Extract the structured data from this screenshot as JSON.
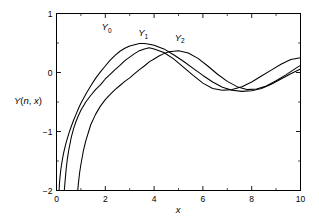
{
  "chart_data": {
    "type": "line",
    "title": "",
    "subtitle": "",
    "xlabel": "x",
    "ylabel": "Y(n, x)",
    "xlim": [
      0,
      10
    ],
    "ylim": [
      -2,
      1
    ],
    "grid": false,
    "legend_position": "inline-annotations",
    "x_ticks_major": [
      0,
      2,
      4,
      6,
      8,
      10
    ],
    "x_ticks_major_labels": [
      "0",
      "2",
      "4",
      "6",
      "8",
      "10"
    ],
    "x_ticks_minor": [
      1,
      3,
      5,
      7,
      9
    ],
    "y_ticks_major": [
      1,
      0,
      -1,
      -2
    ],
    "y_ticks_major_labels": [
      "1",
      "0",
      "−1",
      "−2"
    ],
    "y_ticks_minor": [
      0.5,
      -0.5,
      -1.5
    ],
    "annotations": [
      {
        "name": "Y0",
        "text": "Y",
        "sub": "0",
        "x": 2.05,
        "y": 0.72
      },
      {
        "name": "Y1",
        "text": "Y",
        "sub": "1",
        "x": 3.55,
        "y": 0.62
      },
      {
        "name": "Y2",
        "text": "Y",
        "sub": "2",
        "x": 5.05,
        "y": 0.54
      }
    ],
    "series": [
      {
        "name": "Y0",
        "label": "Y₀",
        "color": "#000000",
        "x": [
          0.105,
          0.12,
          0.14,
          0.16,
          0.18,
          0.2,
          0.25,
          0.3,
          0.35,
          0.4,
          0.5,
          0.6,
          0.7,
          0.8,
          0.9,
          1.0,
          1.2,
          1.4,
          1.6,
          1.8,
          2.0,
          2.2,
          2.4,
          2.6,
          2.8,
          3.0,
          3.2,
          3.4,
          3.6,
          3.8,
          4.0,
          4.4,
          4.8,
          5.2,
          5.6,
          6.0,
          6.4,
          6.8,
          7.2,
          7.6,
          8.0,
          8.4,
          8.8,
          9.2,
          9.6,
          10.0
        ],
        "y": [
          -2.0,
          -1.89,
          -1.79,
          -1.71,
          -1.64,
          -1.58,
          -1.45,
          -1.35,
          -1.26,
          -1.18,
          -1.04,
          -0.92,
          -0.81,
          -0.71,
          -0.61,
          -0.52,
          -0.37,
          -0.23,
          -0.1,
          0.01,
          0.11,
          0.21,
          0.29,
          0.36,
          0.41,
          0.45,
          0.47,
          0.49,
          0.49,
          0.48,
          0.46,
          0.4,
          0.3,
          0.19,
          0.07,
          -0.05,
          -0.16,
          -0.25,
          -0.3,
          -0.32,
          -0.31,
          -0.27,
          -0.2,
          -0.11,
          -0.02,
          0.06
        ],
        "y_approx_note": "Bessel Y0(x)"
      },
      {
        "name": "Y1",
        "label": "Y₁",
        "color": "#000000",
        "x": [
          0.32,
          0.35,
          0.4,
          0.45,
          0.5,
          0.6,
          0.7,
          0.8,
          0.9,
          1.0,
          1.2,
          1.4,
          1.6,
          1.8,
          2.0,
          2.2,
          2.4,
          2.6,
          2.8,
          3.0,
          3.2,
          3.4,
          3.6,
          3.8,
          4.0,
          4.4,
          4.8,
          5.2,
          5.6,
          6.0,
          6.4,
          6.8,
          7.2,
          7.6,
          8.0,
          8.4,
          8.8,
          9.2,
          9.6,
          10.0
        ],
        "y": [
          -2.0,
          -1.85,
          -1.62,
          -1.45,
          -1.32,
          -1.11,
          -0.95,
          -0.83,
          -0.73,
          -0.64,
          -0.5,
          -0.39,
          -0.29,
          -0.21,
          -0.11,
          -0.03,
          0.05,
          0.12,
          0.2,
          0.26,
          0.32,
          0.37,
          0.4,
          0.42,
          0.4,
          0.34,
          0.23,
          0.09,
          -0.05,
          -0.18,
          -0.27,
          -0.3,
          -0.29,
          -0.24,
          -0.16,
          -0.06,
          0.04,
          0.14,
          0.22,
          0.25
        ],
        "y_approx_note": "Bessel Y1(x)"
      },
      {
        "name": "Y2",
        "label": "Y₂",
        "color": "#000000",
        "x": [
          0.87,
          0.9,
          0.95,
          1.0,
          1.1,
          1.2,
          1.4,
          1.6,
          1.8,
          2.0,
          2.2,
          2.4,
          2.6,
          2.8,
          3.0,
          3.2,
          3.4,
          3.6,
          3.8,
          4.0,
          4.2,
          4.4,
          4.6,
          4.8,
          5.0,
          5.4,
          5.8,
          6.2,
          6.6,
          7.0,
          7.4,
          7.8,
          8.2,
          8.6,
          9.0,
          9.4,
          9.8,
          10.0
        ],
        "y": [
          -2.0,
          -1.87,
          -1.69,
          -1.56,
          -1.33,
          -1.16,
          -0.89,
          -0.71,
          -0.57,
          -0.46,
          -0.37,
          -0.29,
          -0.22,
          -0.15,
          -0.09,
          -0.02,
          0.05,
          0.11,
          0.18,
          0.23,
          0.28,
          0.32,
          0.35,
          0.36,
          0.37,
          0.33,
          0.24,
          0.11,
          -0.03,
          -0.15,
          -0.24,
          -0.29,
          -0.28,
          -0.23,
          -0.14,
          -0.04,
          0.07,
          0.12
        ],
        "y_approx_note": "Bessel Y2(x)"
      }
    ]
  },
  "axes": {
    "xlabel": "x",
    "ylabel_main": "Y",
    "ylabel_paren_open": "(",
    "ylabel_n": "n",
    "ylabel_comma": ", ",
    "ylabel_x": "x",
    "ylabel_paren_close": ")"
  },
  "colors": {
    "background": "#ffffff",
    "foreground": "#000000",
    "curve": "#000000"
  }
}
